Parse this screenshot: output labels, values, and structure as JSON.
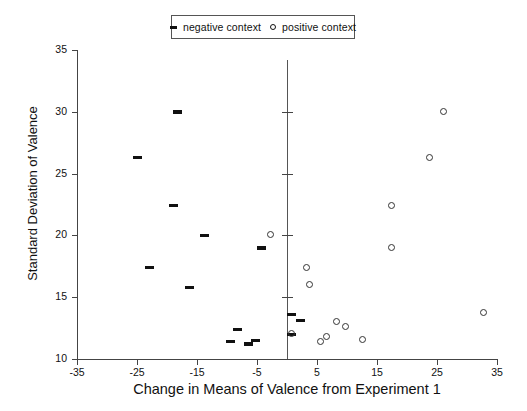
{
  "chart_data": {
    "type": "scatter",
    "title": "",
    "xlabel": "Change in Means of Valence from Experiment 1",
    "ylabel": "Standard Deviation of Valence",
    "xlim": [
      -35,
      35
    ],
    "ylim": [
      10,
      35
    ],
    "xticks": [
      -35,
      -25,
      -15,
      -5,
      5,
      15,
      25,
      35
    ],
    "yticks": [
      10,
      15,
      20,
      25,
      30,
      35
    ],
    "xtick_labels": [
      "-35",
      "-25",
      "-15",
      "-5",
      "5",
      "15",
      "25",
      "35"
    ],
    "ytick_labels": [
      "10",
      "15",
      "20",
      "25",
      "30",
      "35"
    ],
    "grid": false,
    "legend_position": "top-center",
    "zero_reference_line": 0,
    "series": [
      {
        "name": "negative context",
        "marker": "dash",
        "color": "#111111",
        "points": [
          {
            "x": -18.3,
            "y": 30.0
          },
          {
            "x": -25.0,
            "y": 26.3
          },
          {
            "x": -19.0,
            "y": 22.4
          },
          {
            "x": -13.8,
            "y": 20.0
          },
          {
            "x": -23.0,
            "y": 17.4
          },
          {
            "x": -16.3,
            "y": 15.8
          },
          {
            "x": -4.2,
            "y": 19.0
          },
          {
            "x": -8.3,
            "y": 12.4
          },
          {
            "x": -9.5,
            "y": 11.4
          },
          {
            "x": -6.5,
            "y": 11.2
          },
          {
            "x": -5.2,
            "y": 11.5
          },
          {
            "x": 0.8,
            "y": 13.6
          },
          {
            "x": 2.2,
            "y": 13.1
          },
          {
            "x": 0.8,
            "y": 12.0
          }
        ]
      },
      {
        "name": "positive context",
        "marker": "circle",
        "color": "#333333",
        "points": [
          {
            "x": 26.0,
            "y": 30.0
          },
          {
            "x": 23.7,
            "y": 26.3
          },
          {
            "x": 17.4,
            "y": 22.4
          },
          {
            "x": 17.4,
            "y": 19.0
          },
          {
            "x": -2.8,
            "y": 20.1
          },
          {
            "x": 3.2,
            "y": 17.4
          },
          {
            "x": 3.8,
            "y": 16.0
          },
          {
            "x": 0.8,
            "y": 12.1
          },
          {
            "x": 8.2,
            "y": 13.0
          },
          {
            "x": 9.7,
            "y": 12.6
          },
          {
            "x": 6.5,
            "y": 11.8
          },
          {
            "x": 5.5,
            "y": 11.4
          },
          {
            "x": 12.5,
            "y": 11.6
          },
          {
            "x": 32.8,
            "y": 13.8
          }
        ]
      }
    ]
  },
  "legend": {
    "entries": [
      {
        "label": "negative context",
        "marker": "dash"
      },
      {
        "label": "positive context",
        "marker": "circle"
      }
    ]
  }
}
